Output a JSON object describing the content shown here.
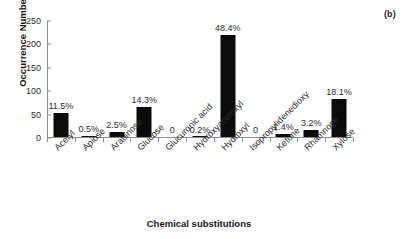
{
  "figure": {
    "panel_label": "(b)"
  },
  "chart_data": {
    "type": "bar",
    "title": "",
    "xlabel": "Chemical substitutions",
    "ylabel": "Occurrence Numbers",
    "ylim": [
      0,
      250
    ],
    "yticks": [
      0,
      50,
      100,
      150,
      200,
      250
    ],
    "grid": false,
    "legend": null,
    "bar_color": "#0b0b0b",
    "categories": [
      "Acetyl",
      "Apiose",
      "Arabinose",
      "Glucose",
      "Glucuronic acid",
      "Hydroxyacetoxyl",
      "Hydroxyl",
      "Isopropylidenedioxy",
      "Ketone",
      "Rhamnose",
      "Xylose"
    ],
    "values": [
      52,
      2,
      11,
      64,
      0,
      1,
      217,
      0,
      6,
      14,
      81
    ],
    "data_labels": [
      "11.5%",
      "0.5%",
      "2.5%",
      "14.3%",
      "0",
      "0.2%",
      "48.4%",
      "0",
      "1.4%",
      "3.2%",
      "18.1%"
    ]
  }
}
